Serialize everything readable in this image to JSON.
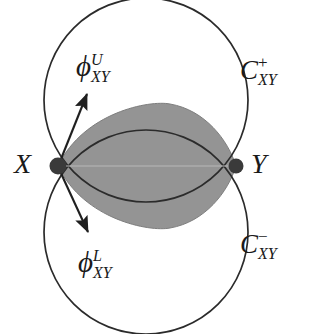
{
  "figure": {
    "background_color": "#ffffff",
    "stroke_color": "#2b2b2b",
    "lens_fill_color": "#949494",
    "node_color": "#3a3a3a",
    "width": 320,
    "height": 334
  },
  "nodes": [
    {
      "id": "X",
      "label": "X",
      "cx": 58,
      "cy": 166,
      "r": 8
    },
    {
      "id": "Y",
      "label": "Y",
      "cx": 236,
      "cy": 166,
      "r": 7
    }
  ],
  "labels": {
    "node_x": {
      "base": "X"
    },
    "node_y": {
      "base": "Y"
    },
    "phi_upper": {
      "base": "ϕ",
      "sup": "U",
      "sub": "XY"
    },
    "phi_lower": {
      "base": "ϕ",
      "sup": "L",
      "sub": "XY"
    },
    "c_plus": {
      "base": "C",
      "sup": "+",
      "sub": "XY"
    },
    "c_minus": {
      "base": "C",
      "sup": "−",
      "sub": "XY"
    }
  },
  "arrows": [
    {
      "id": "phi-upper-arrow",
      "from_x": 59,
      "from_y": 164,
      "to_x": 89,
      "to_y": 90
    },
    {
      "id": "phi-lower-arrow",
      "from_x": 59,
      "from_y": 169,
      "to_x": 90,
      "to_y": 237
    }
  ],
  "circles": {
    "upper": {
      "cx": 146,
      "cy": 100,
      "r": 102,
      "name": "C_XY_plus"
    },
    "lower": {
      "cx": 146,
      "cy": 232,
      "r": 102,
      "name": "C_XY_minus"
    }
  },
  "lens": {
    "left_x": 58,
    "right_x": 236,
    "top_y": 105,
    "bottom_y": 226
  }
}
